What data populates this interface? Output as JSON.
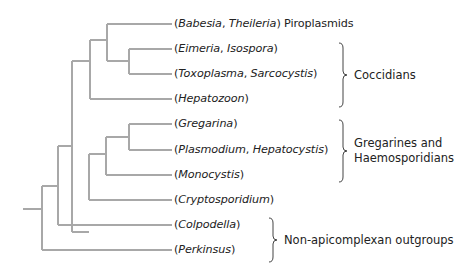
{
  "diagram": {
    "type": "phylogenetic-tree",
    "line_color": "#a8a8a8",
    "text_color": "#222222",
    "leaves": [
      {
        "id": "babesia",
        "taxa": [
          "Babesia",
          "Theileria"
        ],
        "suffix": " Piroplasmids",
        "y": 24
      },
      {
        "id": "eimeria",
        "taxa": [
          "Eimeria",
          "Isospora"
        ],
        "suffix": "",
        "y": 49
      },
      {
        "id": "toxoplasma",
        "taxa": [
          "Toxoplasma",
          "Sarcocystis"
        ],
        "suffix": "",
        "y": 74
      },
      {
        "id": "hepatozoon",
        "taxa": [
          "Hepatozoon"
        ],
        "suffix": "",
        "y": 99
      },
      {
        "id": "gregarina",
        "taxa": [
          "Gregarina"
        ],
        "suffix": "",
        "y": 124
      },
      {
        "id": "plasmodium",
        "taxa": [
          "Plasmodium",
          "Hepatocystis"
        ],
        "suffix": "",
        "y": 150
      },
      {
        "id": "monocystis",
        "taxa": [
          "Monocystis"
        ],
        "suffix": "",
        "y": 175
      },
      {
        "id": "cryptosporidium",
        "taxa": [
          "Cryptosporidium"
        ],
        "suffix": "",
        "y": 200
      },
      {
        "id": "colpodella",
        "taxa": [
          "Colpodella"
        ],
        "suffix": "",
        "y": 225
      },
      {
        "id": "perkinsus",
        "taxa": [
          "Perkinsus"
        ],
        "suffix": "",
        "y": 250
      }
    ],
    "groups": [
      {
        "id": "coccidians",
        "lines": [
          "Coccidians"
        ],
        "brace_x": 343,
        "top": 43,
        "bottom": 107,
        "mid": 75,
        "text_x": 354
      },
      {
        "id": "gregarines-haemosporidians",
        "lines": [
          "Gregarines and",
          "Haemosporidians"
        ],
        "brace_x": 343,
        "top": 120,
        "bottom": 182,
        "mid": 151,
        "text_x": 354
      },
      {
        "id": "outgroups",
        "lines": [
          "Non-apicomplexan outgroups"
        ],
        "brace_x": 273,
        "top": 218,
        "bottom": 262,
        "mid": 240,
        "text_x": 284
      }
    ],
    "tree_paths": [
      "M23 209 H42",
      "M42 186 V250 M42 186 H58 M42 250 H172",
      "M58 146 V225 M58 146 H72 M58 225 H172",
      "M72 61 V232 M72 61 H90",
      "M90 40 V99 M90 40 H107 M90 99 H172",
      "M107 24 V61 M107 24 H172 M107 61 H129",
      "M129 49 V74 M129 49 H172 M129 74 H172",
      "M72 232 H89",
      "M89 154 V200 M89 154 H106 M89 200 H172",
      "M106 137 V175 M106 137 H129 M106 175 H172",
      "M129 124 V150 M129 124 H172 M129 150 H172"
    ]
  }
}
